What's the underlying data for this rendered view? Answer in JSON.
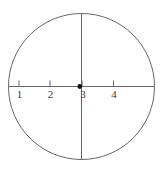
{
  "figure": {
    "type": "number-line-in-circle",
    "background_color": "#ffffff",
    "stroke_color": "#555555",
    "label_color": "#3a3a3a",
    "point_color": "#111111"
  },
  "circle": {
    "center_x": 81.5,
    "center_y": 86.5,
    "radius": 73.0,
    "stroke_width": 0.9
  },
  "axes": {
    "horizontal": {
      "name": "number-line",
      "y": 86.5,
      "x_start": 9.0,
      "x_end": 154.0,
      "stroke_width": 0.9
    },
    "vertical": {
      "name": "vertical-axis",
      "x": 81.5,
      "y_start": 13.5,
      "y_end": 159.5,
      "stroke_width": 0.9
    }
  },
  "ticks": [
    {
      "label": "1",
      "x": 19.0,
      "label_x": 12.5,
      "label_y": 89.0
    },
    {
      "label": "2",
      "x": 50.0,
      "label_x": 43.5,
      "label_y": 89.0
    },
    {
      "label": "3",
      "x": 82.0,
      "label_x": 76.0,
      "label_y": 89.0
    },
    {
      "label": "4",
      "x": 113.5,
      "label_x": 107.0,
      "label_y": 89.0
    }
  ],
  "tick_geometry": {
    "top": 80.5,
    "bottom": 86.5,
    "stroke_width": 0.9
  },
  "point": {
    "name": "plotted-point",
    "x": 79.8,
    "y": 86.5,
    "radius": 2.4
  }
}
